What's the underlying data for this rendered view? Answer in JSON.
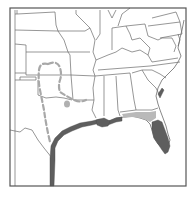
{
  "map": {
    "title": "",
    "region": "Southeastern United States",
    "colors": {
      "background": "#ffffff",
      "state_borders": "#6a6a6a",
      "range_primary": "#5e5e5e",
      "range_secondary": "#b9b9b9",
      "range_outline_dashed": "#a8a8a8",
      "frame": "#555555"
    },
    "legend": [],
    "layers": [
      {
        "name": "state-boundaries",
        "style": "thin gray lines"
      },
      {
        "name": "primary-range",
        "style": "dark gray fill",
        "areas": [
          "Texas Gulf coast",
          "Louisiana coast",
          "Mississippi/Alabama coast",
          "Florida peninsula",
          "South Carolina coast"
        ]
      },
      {
        "name": "secondary-range",
        "style": "light gray fill",
        "areas": [
          "Florida panhandle coast",
          "Georgia/Florida border band"
        ]
      },
      {
        "name": "dashed-range-outline",
        "style": "dashed gray line",
        "areas": [
          "Oklahoma / north Texas"
        ]
      },
      {
        "name": "isolated-spot",
        "style": "light gray dot",
        "areas": [
          "Arkansas/Louisiana"
        ]
      }
    ]
  }
}
